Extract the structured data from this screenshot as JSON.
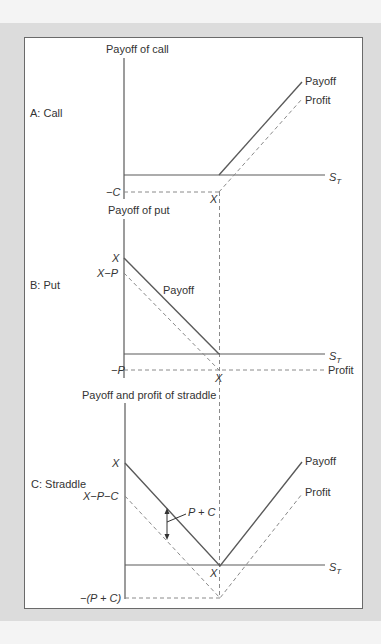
{
  "figure": {
    "panels": [
      {
        "id": "A",
        "panel_label": "A: Call",
        "y_axis_title": "Payoff of call",
        "x_axis_label": "S",
        "x_axis_subscript": "T",
        "strike_label": "X",
        "neg_label": "−C",
        "series": [
          {
            "name": "Payoff",
            "style": "solid"
          },
          {
            "name": "Profit",
            "style": "dashed"
          }
        ]
      },
      {
        "id": "B",
        "panel_label": "B: Put",
        "y_axis_title": "Payoff of put",
        "x_axis_label": "S",
        "x_axis_subscript": "T",
        "strike_label": "X",
        "y_top_label": "X",
        "y_second_label": "X−P",
        "neg_label": "−P",
        "series": [
          {
            "name": "Payoff",
            "style": "solid"
          },
          {
            "name": "Profit",
            "style": "dashed"
          }
        ]
      },
      {
        "id": "C",
        "panel_label": "C: Straddle",
        "y_axis_title": "Payoff and profit of straddle",
        "x_axis_label": "S",
        "x_axis_subscript": "T",
        "strike_label": "X",
        "y_top_label": "X",
        "y_second_label": "X−P−C",
        "neg_label": "−(P + C)",
        "gap_label": "P + C",
        "series": [
          {
            "name": "Payoff",
            "style": "solid"
          },
          {
            "name": "Profit",
            "style": "dashed"
          }
        ]
      }
    ],
    "colors": {
      "line": "#5a5a5a",
      "dashed": "#8a8a8a",
      "text": "#333333",
      "frame_bg": "#dcdcdc",
      "panel_bg": "#ffffff"
    }
  }
}
